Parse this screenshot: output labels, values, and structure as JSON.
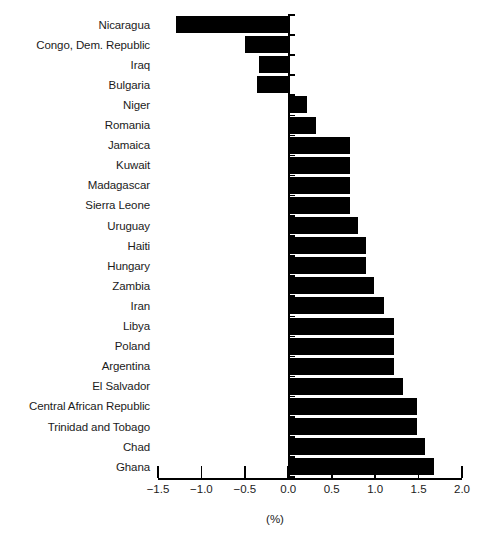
{
  "chart_data": {
    "type": "bar",
    "orientation": "horizontal",
    "title": "",
    "subtitle": "",
    "xlabel": "(%)",
    "ylabel": "",
    "xlim": [
      -1.5,
      2.0
    ],
    "xticks": [
      -1.5,
      -1.0,
      -0.5,
      0.0,
      0.5,
      1.0,
      1.5,
      2.0
    ],
    "xtick_labels": [
      "−1.5",
      "−1.0",
      "−0.5",
      "0.0",
      "0.5",
      "1.0",
      "1.5",
      "2.0"
    ],
    "grid": false,
    "legend": null,
    "bar_color": "#000000",
    "categories": [
      "Nicaragua",
      "Congo, Dem. Republic",
      "Iraq",
      "Bulgaria",
      "Niger",
      "Romania",
      "Jamaica",
      "Kuwait",
      "Madagascar",
      "Sierra Leone",
      "Uruguay",
      "Haiti",
      "Hungary",
      "Zambia",
      "Iran",
      "Libya",
      "Poland",
      "Argentina",
      "El Salvador",
      "Central African Republic",
      "Trinidad and Tobago",
      "Chad",
      "Ghana"
    ],
    "values": [
      -1.29,
      -0.5,
      -0.34,
      -0.36,
      0.21,
      0.32,
      0.71,
      0.71,
      0.71,
      0.71,
      0.8,
      0.89,
      0.89,
      0.99,
      1.1,
      1.22,
      1.22,
      1.22,
      1.32,
      1.48,
      1.48,
      1.57,
      1.68
    ]
  },
  "bottom_caption": ""
}
